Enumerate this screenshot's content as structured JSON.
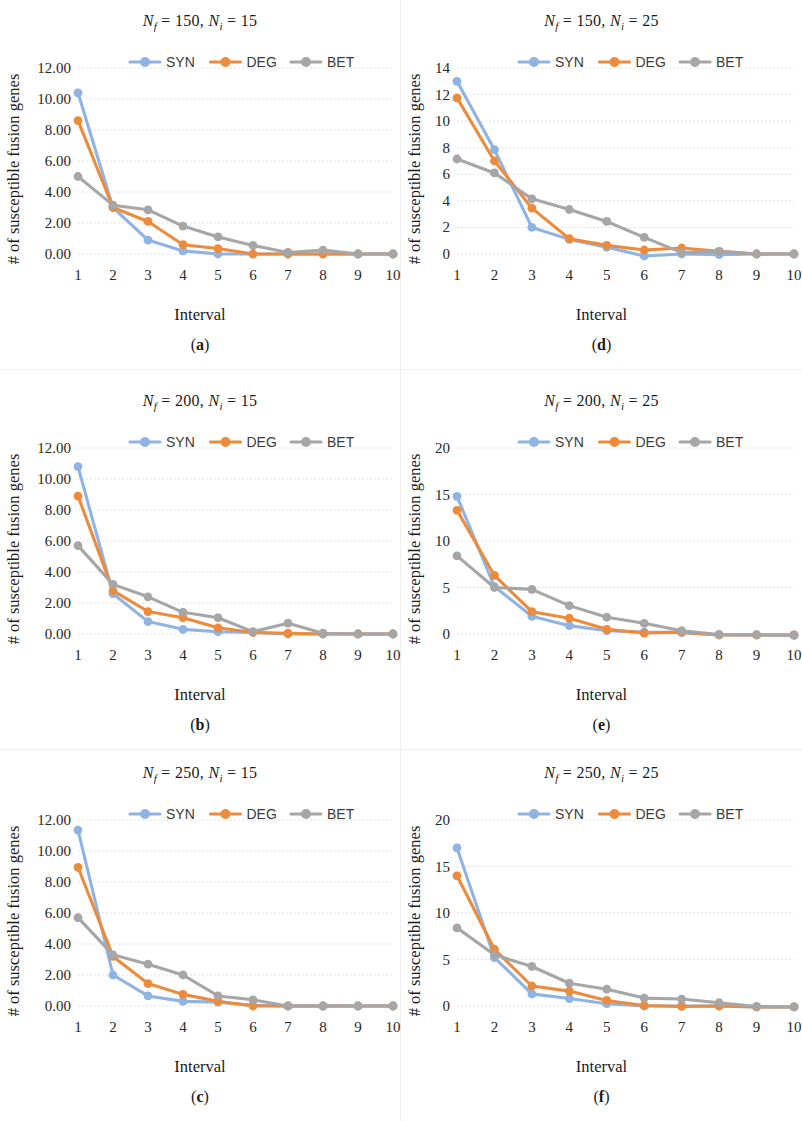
{
  "figure": {
    "series_names": [
      "SYN",
      "DEG",
      "BET"
    ],
    "colors": {
      "SYN": "#8FB4E3",
      "DEG": "#ED8B3C",
      "BET": "#A6A6A6"
    },
    "x_axis_label": "Interval",
    "y_axis_label": "# of susceptible fusion genes",
    "x_categories": [
      1,
      2,
      3,
      4,
      5,
      6,
      7,
      8,
      9,
      10
    ]
  },
  "panels": [
    {
      "key": "a",
      "sublabel": "(a)",
      "sublabel_open": "(",
      "sublabel_letter": "a",
      "sublabel_close": ")",
      "title_n_f": "150",
      "title_n_i": "15",
      "chart_data": {
        "type": "line",
        "title": "Nf = 150, Ni = 15",
        "xlabel": "Interval",
        "ylabel": "# of susceptible fusion genes",
        "categories": [
          1,
          2,
          3,
          4,
          5,
          6,
          7,
          8,
          9,
          10
        ],
        "ylim": [
          0.0,
          12.0
        ],
        "yticks": [
          "0.00",
          "2.00",
          "4.00",
          "6.00",
          "8.00",
          "10.00",
          "12.00"
        ],
        "ytick_values": [
          0,
          2,
          4,
          6,
          8,
          10,
          12
        ],
        "grid": true,
        "legend": "top-center",
        "series": [
          {
            "name": "SYN",
            "values": [
              10.4,
              3.0,
              0.9,
              0.2,
              0.0,
              0.0,
              0.0,
              0.0,
              0.0,
              0.0
            ]
          },
          {
            "name": "DEG",
            "values": [
              8.6,
              3.0,
              2.1,
              0.6,
              0.35,
              0.0,
              0.0,
              0.0,
              0.0,
              0.0
            ]
          },
          {
            "name": "BET",
            "values": [
              5.0,
              3.15,
              2.85,
              1.8,
              1.1,
              0.55,
              0.1,
              0.25,
              0.0,
              0.0
            ]
          }
        ]
      }
    },
    {
      "key": "d",
      "sublabel": "(d)",
      "sublabel_open": "(",
      "sublabel_letter": "d",
      "sublabel_close": ")",
      "title_n_f": "150",
      "title_n_i": "25",
      "chart_data": {
        "type": "line",
        "title": "Nf = 150, Ni = 25",
        "xlabel": "Interval",
        "ylabel": "# of susceptible fusion genes",
        "categories": [
          1,
          2,
          3,
          4,
          5,
          6,
          7,
          8,
          9,
          10
        ],
        "ylim": [
          0,
          14
        ],
        "yticks": [
          "0",
          "2",
          "4",
          "6",
          "8",
          "10",
          "12",
          "14"
        ],
        "ytick_values": [
          0,
          2,
          4,
          6,
          8,
          10,
          12,
          14
        ],
        "grid": true,
        "legend": "top-center",
        "series": [
          {
            "name": "SYN",
            "values": [
              13.0,
              7.85,
              2.0,
              1.1,
              0.5,
              -0.15,
              0.0,
              -0.05,
              0.0,
              0.0
            ]
          },
          {
            "name": "DEG",
            "values": [
              11.75,
              7.0,
              3.45,
              1.15,
              0.65,
              0.3,
              0.45,
              0.2,
              0.0,
              0.0
            ]
          },
          {
            "name": "BET",
            "values": [
              7.15,
              6.1,
              4.15,
              3.35,
              2.45,
              1.25,
              0.1,
              0.2,
              0.0,
              0.0
            ]
          }
        ]
      }
    },
    {
      "key": "b",
      "sublabel": "(b)",
      "sublabel_open": "(",
      "sublabel_letter": "b",
      "sublabel_close": ")",
      "title_n_f": "200",
      "title_n_i": "15",
      "chart_data": {
        "type": "line",
        "title": "Nf = 200, Ni = 15",
        "xlabel": "Interval",
        "ylabel": "# of susceptible fusion genes",
        "categories": [
          1,
          2,
          3,
          4,
          5,
          6,
          7,
          8,
          9,
          10
        ],
        "ylim": [
          0.0,
          12.0
        ],
        "yticks": [
          "0.00",
          "2.00",
          "4.00",
          "6.00",
          "8.00",
          "10.00",
          "12.00"
        ],
        "ytick_values": [
          0,
          2,
          4,
          6,
          8,
          10,
          12
        ],
        "grid": true,
        "legend": "top-center",
        "series": [
          {
            "name": "SYN",
            "values": [
              10.8,
              2.6,
              0.8,
              0.3,
              0.15,
              0.1,
              0.0,
              0.0,
              0.0,
              0.0
            ]
          },
          {
            "name": "DEG",
            "values": [
              8.9,
              2.8,
              1.45,
              1.05,
              0.4,
              0.1,
              0.05,
              0.0,
              0.0,
              0.0
            ]
          },
          {
            "name": "BET",
            "values": [
              5.7,
              3.2,
              2.4,
              1.4,
              1.05,
              0.15,
              0.7,
              0.05,
              0.0,
              0.0
            ]
          }
        ]
      }
    },
    {
      "key": "e",
      "sublabel": "(e)",
      "sublabel_open": "(",
      "sublabel_letter": "e",
      "sublabel_close": ")",
      "title_n_f": "200",
      "title_n_i": "25",
      "chart_data": {
        "type": "line",
        "title": "Nf = 200, Ni = 25",
        "xlabel": "Interval",
        "ylabel": "# of susceptible fusion genes",
        "categories": [
          1,
          2,
          3,
          4,
          5,
          6,
          7,
          8,
          9,
          10
        ],
        "ylim": [
          0,
          20
        ],
        "yticks": [
          "0",
          "5",
          "10",
          "15",
          "20"
        ],
        "ytick_values": [
          0,
          5,
          10,
          15,
          20
        ],
        "grid": true,
        "legend": "top-center",
        "series": [
          {
            "name": "SYN",
            "values": [
              14.8,
              5.1,
              1.9,
              0.9,
              0.35,
              0.2,
              0.15,
              -0.1,
              -0.1,
              -0.1
            ]
          },
          {
            "name": "DEG",
            "values": [
              13.3,
              6.3,
              2.4,
              1.7,
              0.5,
              0.1,
              0.2,
              -0.1,
              -0.1,
              -0.1
            ]
          },
          {
            "name": "BET",
            "values": [
              8.4,
              5.0,
              4.8,
              3.05,
              1.8,
              1.15,
              0.35,
              -0.05,
              -0.1,
              -0.15
            ]
          }
        ]
      }
    },
    {
      "key": "c",
      "sublabel": "(c)",
      "sublabel_open": "(",
      "sublabel_letter": "c",
      "sublabel_close": ")",
      "title_n_f": "250",
      "title_n_i": "15",
      "chart_data": {
        "type": "line",
        "title": "Nf = 250, Ni = 15",
        "xlabel": "Interval",
        "ylabel": "# of susceptible fusion genes",
        "categories": [
          1,
          2,
          3,
          4,
          5,
          6,
          7,
          8,
          9,
          10
        ],
        "ylim": [
          0.0,
          12.0
        ],
        "yticks": [
          "0.00",
          "2.00",
          "4.00",
          "6.00",
          "8.00",
          "10.00",
          "12.00"
        ],
        "ytick_values": [
          0,
          2,
          4,
          6,
          8,
          10,
          12
        ],
        "grid": true,
        "legend": "top-center",
        "series": [
          {
            "name": "SYN",
            "values": [
              11.35,
              2.0,
              0.65,
              0.3,
              0.25,
              0.05,
              0.0,
              0.0,
              0.0,
              0.0
            ]
          },
          {
            "name": "DEG",
            "values": [
              8.95,
              3.2,
              1.45,
              0.75,
              0.3,
              0.0,
              0.0,
              0.0,
              0.0,
              0.0
            ]
          },
          {
            "name": "BET",
            "values": [
              5.7,
              3.3,
              2.7,
              2.0,
              0.65,
              0.4,
              0.0,
              0.0,
              0.0,
              0.0
            ]
          }
        ]
      }
    },
    {
      "key": "f",
      "sublabel": "(f)",
      "sublabel_open": "(",
      "sublabel_letter": "f",
      "sublabel_close": ")",
      "title_n_f": "250",
      "title_n_i": "25",
      "chart_data": {
        "type": "line",
        "title": "Nf = 250, Ni = 25",
        "xlabel": "Interval",
        "ylabel": "# of susceptible fusion genes",
        "categories": [
          1,
          2,
          3,
          4,
          5,
          6,
          7,
          8,
          9,
          10
        ],
        "ylim": [
          0,
          20
        ],
        "yticks": [
          "0",
          "5",
          "10",
          "15",
          "20"
        ],
        "ytick_values": [
          0,
          5,
          10,
          15,
          20
        ],
        "grid": true,
        "legend": "top-center",
        "series": [
          {
            "name": "SYN",
            "values": [
              17.0,
              5.2,
              1.3,
              0.8,
              0.25,
              0.0,
              0.0,
              0.0,
              -0.1,
              -0.1
            ]
          },
          {
            "name": "DEG",
            "values": [
              14.0,
              6.1,
              2.15,
              1.6,
              0.6,
              0.05,
              -0.05,
              0.0,
              -0.1,
              -0.1
            ]
          },
          {
            "name": "BET",
            "values": [
              8.4,
              5.5,
              4.25,
              2.45,
              1.8,
              0.85,
              0.75,
              0.35,
              -0.05,
              -0.1
            ]
          }
        ]
      }
    }
  ]
}
